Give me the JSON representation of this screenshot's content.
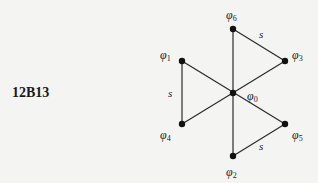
{
  "diagram": {
    "id_label": "12B13",
    "nodes": [
      {
        "id": "phi0",
        "symbol": "φ",
        "sub": "0",
        "x": 233,
        "y": 93,
        "label_x": 247,
        "label_y": 100
      },
      {
        "id": "phi1",
        "symbol": "φ",
        "sub": "1",
        "x": 182,
        "y": 61,
        "label_x": 160,
        "label_y": 59
      },
      {
        "id": "phi2",
        "symbol": "φ",
        "sub": "2",
        "x": 233,
        "y": 156,
        "label_x": 226,
        "label_y": 176
      },
      {
        "id": "phi3",
        "symbol": "φ",
        "sub": "3",
        "x": 285,
        "y": 61,
        "label_x": 292,
        "label_y": 59
      },
      {
        "id": "phi4",
        "symbol": "φ",
        "sub": "4",
        "x": 182,
        "y": 124,
        "label_x": 160,
        "label_y": 139
      },
      {
        "id": "phi5",
        "symbol": "φ",
        "sub": "5",
        "x": 285,
        "y": 124,
        "label_x": 292,
        "label_y": 139
      },
      {
        "id": "phi6",
        "symbol": "φ",
        "sub": "6",
        "x": 233,
        "y": 29,
        "label_x": 226,
        "label_y": 19
      }
    ],
    "edges": [
      {
        "from": "phi6",
        "to": "phi2",
        "label": ""
      },
      {
        "from": "phi1",
        "to": "phi5",
        "label": ""
      },
      {
        "from": "phi4",
        "to": "phi3",
        "label": ""
      },
      {
        "from": "phi6",
        "to": "phi3",
        "label": "s",
        "label_x": 259,
        "label_y": 38
      },
      {
        "from": "phi1",
        "to": "phi4",
        "label": "s",
        "label_x": 168,
        "label_y": 97
      },
      {
        "from": "phi2",
        "to": "phi5",
        "label": "s",
        "label_x": 259,
        "label_y": 150
      }
    ]
  }
}
